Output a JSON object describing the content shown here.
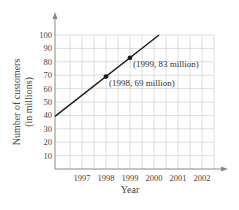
{
  "chart_data": {
    "type": "line",
    "title": "",
    "xlabel": "Year",
    "ylabel": "Number of customers (in millions)",
    "ylabel_lines": [
      "Number of customers",
      "(in millions)"
    ],
    "x_ticks": [
      1997,
      1998,
      1999,
      2000,
      2001,
      2002
    ],
    "y_ticks": [
      10,
      20,
      30,
      40,
      50,
      60,
      70,
      80,
      90,
      100
    ],
    "xlim": [
      1995.875,
      2002.5
    ],
    "ylim": [
      0,
      105
    ],
    "grid": true,
    "series": [
      {
        "name": "Number of customers",
        "slope_per_year": 14,
        "x": [
          1995.875,
          2000.21
        ],
        "values": [
          39.25,
          100
        ]
      }
    ],
    "points": [
      {
        "x": 1998,
        "y": 69,
        "label": "(1998, 69 million)"
      },
      {
        "x": 1999,
        "y": 83,
        "label": "(1999, 83 million)"
      }
    ],
    "colors": {
      "line": "#1a1a1a",
      "grid": "#d6d6d6",
      "axis": "#888888"
    }
  }
}
